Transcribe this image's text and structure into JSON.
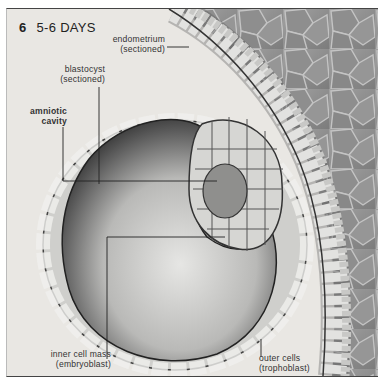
{
  "figure": {
    "number": "6",
    "title": "5-6 DAYS"
  },
  "labels": {
    "endometrium": {
      "line1": "endometrium",
      "line2": "(sectioned)"
    },
    "blastocyst": {
      "line1": "blastocyst",
      "line2": "(sectioned)"
    },
    "amniotic_cavity": {
      "line1": "amniotic",
      "line2": "cavity"
    },
    "inner_cell_mass": {
      "line1": "inner cell mass",
      "line2": "(embryoblast)"
    },
    "outer_cells": {
      "line1": "outer cells",
      "line2": "(trophoblast)"
    }
  },
  "colors": {
    "background": "#e9e7e3",
    "tissue": "#8a8a8a",
    "cell_fill": "#d8d8d4",
    "cell_edge": "#4a4a4a",
    "cavity_dark": "#3a3a3a"
  }
}
